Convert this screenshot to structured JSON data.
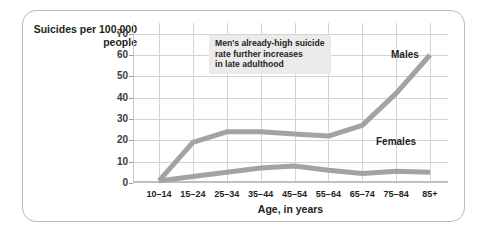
{
  "chart_data": {
    "type": "line",
    "title": "",
    "ylabel": "Suicides per\n100,000 people",
    "xlabel": "Age, in years",
    "categories": [
      "10–14",
      "15–24",
      "25–34",
      "35–44",
      "45–54",
      "55–64",
      "65–74",
      "75–84",
      "85+"
    ],
    "ylim": [
      0,
      75
    ],
    "yticks": [
      0,
      10,
      20,
      30,
      40,
      50,
      60,
      70
    ],
    "ytick_labels": [
      "0",
      "10",
      "20",
      "30",
      "40",
      "50",
      "60",
      "70"
    ],
    "grid": true,
    "legend": "inline-labels",
    "series": [
      {
        "name": "Males",
        "values": [
          1,
          19,
          24,
          24,
          23,
          22,
          27,
          42,
          60
        ],
        "color": "#a3a3a3"
      },
      {
        "name": "Females",
        "values": [
          1,
          3,
          5,
          7,
          8,
          6,
          4.5,
          5.5,
          5
        ],
        "color": "#a3a3a3"
      }
    ],
    "annotations": [
      {
        "text": "Men's already-high suicide\nrate further increases\nin late adulthood",
        "background": "#eceaea"
      }
    ]
  },
  "labels": {
    "y_axis_title": "Suicides per\n100,000 people",
    "x_axis_title": "Age, in years",
    "series_males": "Males",
    "series_females": "Females",
    "annotation": "Men's already-high suicide\nrate further increases\nin late adulthood"
  }
}
